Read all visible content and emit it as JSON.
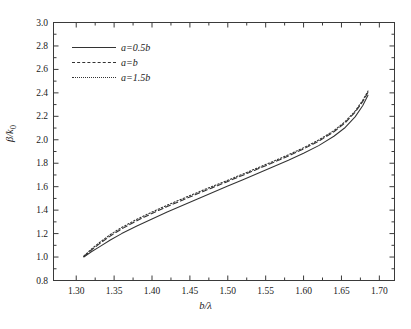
{
  "chart_data": {
    "type": "line",
    "title": "",
    "xlabel": "b/λ",
    "ylabel": "β/k₀",
    "xlim": [
      1.27,
      1.72
    ],
    "ylim": [
      0.8,
      3.0
    ],
    "grid": false,
    "legend_position": "upper-left-inside",
    "xticks": [
      "1.30",
      "1.35",
      "1.40",
      "1.45",
      "1.50",
      "1.55",
      "1.60",
      "1.65",
      "1.70"
    ],
    "xtick_values": [
      1.3,
      1.35,
      1.4,
      1.45,
      1.5,
      1.55,
      1.6,
      1.65,
      1.7
    ],
    "yticks": [
      "0.8",
      "1.0",
      "1.2",
      "1.4",
      "1.6",
      "1.8",
      "2.0",
      "2.2",
      "2.4",
      "2.6",
      "2.8",
      "3.0"
    ],
    "ytick_values": [
      0.8,
      1.0,
      1.2,
      1.4,
      1.6,
      1.8,
      2.0,
      2.2,
      2.4,
      2.6,
      2.8,
      3.0
    ],
    "minor_ticks": true,
    "series": [
      {
        "name": "a=0.5b",
        "style": "solid",
        "color": "#333333",
        "x": [
          1.31,
          1.32,
          1.33,
          1.345,
          1.36,
          1.38,
          1.4,
          1.42,
          1.44,
          1.46,
          1.48,
          1.5,
          1.52,
          1.54,
          1.56,
          1.58,
          1.6,
          1.62,
          1.64,
          1.655,
          1.668,
          1.678,
          1.685
        ],
        "y": [
          1.0,
          1.045,
          1.085,
          1.145,
          1.2,
          1.265,
          1.325,
          1.385,
          1.44,
          1.495,
          1.55,
          1.605,
          1.66,
          1.715,
          1.77,
          1.825,
          1.885,
          1.95,
          2.03,
          2.105,
          2.195,
          2.29,
          2.38
        ]
      },
      {
        "name": "a=b",
        "style": "dashed",
        "color": "#333333",
        "x": [
          1.31,
          1.32,
          1.33,
          1.345,
          1.36,
          1.38,
          1.4,
          1.42,
          1.44,
          1.46,
          1.48,
          1.5,
          1.52,
          1.54,
          1.56,
          1.58,
          1.6,
          1.62,
          1.64,
          1.655,
          1.668,
          1.678,
          1.685
        ],
        "y": [
          1.005,
          1.06,
          1.11,
          1.18,
          1.24,
          1.31,
          1.372,
          1.43,
          1.485,
          1.54,
          1.592,
          1.645,
          1.698,
          1.752,
          1.806,
          1.862,
          1.922,
          1.988,
          2.068,
          2.145,
          2.235,
          2.325,
          2.405
        ]
      },
      {
        "name": "a=1.5b",
        "style": "dotted",
        "color": "#333333",
        "x": [
          1.31,
          1.32,
          1.33,
          1.345,
          1.36,
          1.38,
          1.4,
          1.42,
          1.44,
          1.46,
          1.48,
          1.5,
          1.52,
          1.54,
          1.56,
          1.58,
          1.6,
          1.62,
          1.64,
          1.655,
          1.668,
          1.678,
          1.685
        ],
        "y": [
          1.008,
          1.068,
          1.12,
          1.192,
          1.252,
          1.322,
          1.384,
          1.442,
          1.497,
          1.551,
          1.603,
          1.655,
          1.708,
          1.762,
          1.816,
          1.872,
          1.932,
          1.998,
          2.078,
          2.155,
          2.245,
          2.335,
          2.415
        ]
      }
    ]
  },
  "axes": {
    "x_label": "b/λ",
    "y_label_numerator": "β/k",
    "y_label_subscript": "0"
  },
  "legend": {
    "entries": [
      {
        "label": "a=0.5b",
        "style": "solid"
      },
      {
        "label": "a=b",
        "style": "dashed"
      },
      {
        "label": "a=1.5b",
        "style": "dotted"
      }
    ]
  }
}
